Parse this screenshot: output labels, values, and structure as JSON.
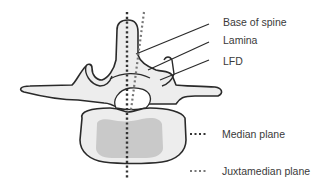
{
  "figure": {
    "type": "vertebra-cross-section",
    "colors": {
      "outline": "#2a2a2a",
      "bone_fill": "#ededed",
      "body_core_fill": "#c9c9c9",
      "median_dots": "#333333",
      "juxtamedian_dots": "#777777",
      "label_text": "#3a3a3a"
    }
  },
  "labels": {
    "base_of_spine": "Base of spine",
    "lamina": "Lamina",
    "lfd": "LFD"
  },
  "legend": {
    "median": {
      "label": "Median plane",
      "style": "dotted-dark"
    },
    "juxtamedian": {
      "label": "Juxtamedian plane",
      "style": "dotted-light"
    }
  }
}
